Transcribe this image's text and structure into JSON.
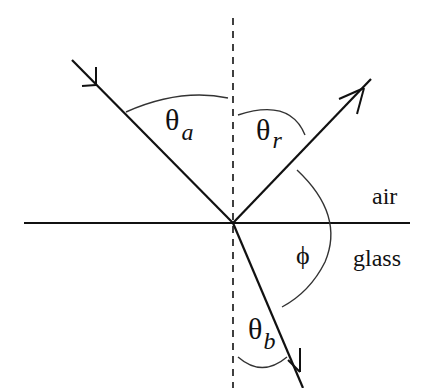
{
  "diagram": {
    "labels": {
      "theta": "θ",
      "sub_a": "a",
      "sub_r": "r",
      "sub_b": "b",
      "phi": "ϕ",
      "air": "air",
      "glass": "glass"
    },
    "colors": {
      "line": "#111111",
      "arc": "#333333",
      "background": "#ffffff"
    },
    "geometry": {
      "interface_y": 223,
      "normal_x": 233,
      "incident": {
        "from": [
          72,
          60
        ],
        "to": [
          233,
          223
        ]
      },
      "reflected": {
        "from": [
          233,
          223
        ],
        "to": [
          371,
          79
        ]
      },
      "refracted": {
        "from": [
          233,
          223
        ],
        "to": [
          303,
          388
        ]
      }
    }
  }
}
